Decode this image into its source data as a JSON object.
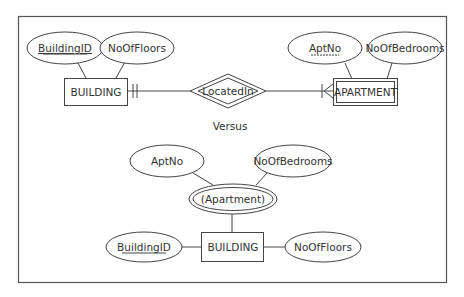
{
  "diagram": {
    "top": {
      "entity_building": {
        "label": "BUILDING"
      },
      "attr_building_id": {
        "label": "BuildingID",
        "key": "primary"
      },
      "attr_no_of_floors": {
        "label": "NoOfFloors"
      },
      "relationship": {
        "label": "LocatedIn",
        "type": "identifying"
      },
      "entity_apartment": {
        "label": "APARTMENT",
        "type": "weak"
      },
      "attr_apt_no": {
        "label": "AptNo",
        "key": "partial"
      },
      "attr_no_of_bedrooms": {
        "label": "NoOfBedrooms"
      },
      "cardinality_building": "one-and-only-one",
      "cardinality_apartment": "one-or-many"
    },
    "separator": {
      "label": "Versus"
    },
    "bottom": {
      "entity_building": {
        "label": "BUILDING"
      },
      "attr_building_id": {
        "label": "BuildingID",
        "key": "primary"
      },
      "attr_no_of_floors": {
        "label": "NoOfFloors"
      },
      "multivalued_attr": {
        "label": "(Apartment)",
        "type": "multivalued-composite"
      },
      "attr_apt_no": {
        "label": "AptNo"
      },
      "attr_no_of_bedrooms": {
        "label": "NoOfBedrooms"
      }
    }
  }
}
